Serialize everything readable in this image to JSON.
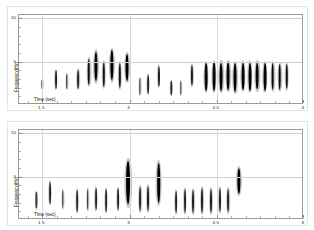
{
  "figure": {
    "panels": [
      {
        "id": "panel-top",
        "name": "top-spectrogram-panel",
        "axis_title_x": "Time (sec)",
        "axis_title_y": "Frequency(Hz)",
        "x_ticks": [
          "1.5",
          "3",
          "4.5",
          "6"
        ],
        "y_ticks": [
          "5",
          "10"
        ]
      },
      {
        "id": "panel-bottom",
        "name": "bottom-spectrogram-panel",
        "axis_title_x": "Time (sec)",
        "axis_title_y": "Frequency(Hz)",
        "x_ticks": [
          "1.5",
          "3",
          "4.5",
          "6"
        ],
        "y_ticks": [
          "5",
          "10"
        ]
      }
    ]
  },
  "chart_data": [
    {
      "type": "scatter",
      "title": "",
      "subtitle": "",
      "xlabel": "Time (sec)",
      "ylabel": "Frequency(Hz)",
      "xlim": [
        1.1,
        6.0
      ],
      "ylim": [
        0.0,
        10.4
      ],
      "xticks": [
        1.5,
        3.0,
        4.5,
        6.0
      ],
      "yticks": [
        5,
        10
      ],
      "grid": true,
      "legend": "none",
      "series": [
        {
          "name": "detected bursts (top channel)",
          "points": [
            {
              "t": 1.5,
              "f_center": 2.4,
              "f_width": 1.05,
              "amp": 0.22
            },
            {
              "t": 1.73,
              "f_center": 2.95,
              "f_width": 2.1,
              "amp": 0.55
            },
            {
              "t": 1.92,
              "f_center": 2.7,
              "f_width": 1.7,
              "amp": 0.45
            },
            {
              "t": 2.12,
              "f_center": 3.0,
              "f_width": 2.2,
              "amp": 0.55
            },
            {
              "t": 2.3,
              "f_center": 3.85,
              "f_width": 3.0,
              "amp": 0.75
            },
            {
              "t": 2.43,
              "f_center": 4.45,
              "f_width": 3.4,
              "amp": 0.92
            },
            {
              "t": 2.56,
              "f_center": 3.55,
              "f_width": 2.9,
              "amp": 0.7
            },
            {
              "t": 2.7,
              "f_center": 4.6,
              "f_width": 3.5,
              "amp": 0.95
            },
            {
              "t": 2.83,
              "f_center": 3.4,
              "f_width": 2.8,
              "amp": 0.68
            },
            {
              "t": 2.96,
              "f_center": 4.35,
              "f_width": 3.1,
              "amp": 0.88
            },
            {
              "t": 3.18,
              "f_center": 2.15,
              "f_width": 1.9,
              "amp": 0.42
            },
            {
              "t": 3.32,
              "f_center": 2.4,
              "f_width": 2.2,
              "amp": 0.5
            },
            {
              "t": 3.5,
              "f_center": 3.3,
              "f_width": 2.4,
              "amp": 0.6
            },
            {
              "t": 3.72,
              "f_center": 2.0,
              "f_width": 1.6,
              "amp": 0.4
            },
            {
              "t": 3.88,
              "f_center": 2.0,
              "f_width": 1.6,
              "amp": 0.4
            },
            {
              "t": 4.08,
              "f_center": 3.45,
              "f_width": 2.4,
              "amp": 0.62
            },
            {
              "t": 4.32,
              "f_center": 3.2,
              "f_width": 3.2,
              "amp": 0.8
            },
            {
              "t": 4.45,
              "f_center": 3.3,
              "f_width": 3.3,
              "amp": 0.82
            },
            {
              "t": 4.58,
              "f_center": 3.25,
              "f_width": 3.3,
              "amp": 0.85
            },
            {
              "t": 4.7,
              "f_center": 3.35,
              "f_width": 3.2,
              "amp": 0.83
            },
            {
              "t": 4.82,
              "f_center": 3.2,
              "f_width": 3.3,
              "amp": 0.86
            },
            {
              "t": 4.95,
              "f_center": 3.3,
              "f_width": 3.2,
              "amp": 0.82
            },
            {
              "t": 5.07,
              "f_center": 3.25,
              "f_width": 3.3,
              "amp": 0.85
            },
            {
              "t": 5.2,
              "f_center": 3.35,
              "f_width": 3.1,
              "amp": 0.8
            },
            {
              "t": 5.33,
              "f_center": 3.2,
              "f_width": 3.2,
              "amp": 0.84
            },
            {
              "t": 5.46,
              "f_center": 3.3,
              "f_width": 3.1,
              "amp": 0.8
            },
            {
              "t": 5.58,
              "f_center": 3.25,
              "f_width": 3.0,
              "amp": 0.78
            },
            {
              "t": 5.7,
              "f_center": 3.3,
              "f_width": 2.9,
              "amp": 0.72
            }
          ]
        }
      ]
    },
    {
      "type": "scatter",
      "title": "",
      "subtitle": "",
      "xlabel": "Time (sec)",
      "ylabel": "Frequency(Hz)",
      "xlim": [
        1.1,
        6.0
      ],
      "ylim": [
        0.0,
        10.4
      ],
      "xticks": [
        1.5,
        3.0,
        4.5,
        6.0
      ],
      "yticks": [
        5,
        10
      ],
      "grid": true,
      "legend": "none",
      "series": [
        {
          "name": "detected bursts (bottom channel)",
          "points": [
            {
              "t": 1.4,
              "f_center": 2.3,
              "f_width": 1.9,
              "amp": 0.28
            },
            {
              "t": 1.63,
              "f_center": 3.1,
              "f_width": 2.6,
              "amp": 0.52
            },
            {
              "t": 1.85,
              "f_center": 2.4,
              "f_width": 2.1,
              "amp": 0.45
            },
            {
              "t": 2.1,
              "f_center": 2.2,
              "f_width": 2.6,
              "amp": 0.48
            },
            {
              "t": 2.28,
              "f_center": 2.35,
              "f_width": 2.5,
              "amp": 0.5
            },
            {
              "t": 2.42,
              "f_center": 2.45,
              "f_width": 2.6,
              "amp": 0.52
            },
            {
              "t": 2.6,
              "f_center": 2.25,
              "f_width": 2.7,
              "amp": 0.5
            },
            {
              "t": 2.8,
              "f_center": 2.4,
              "f_width": 2.5,
              "amp": 0.52
            },
            {
              "t": 2.98,
              "f_center": 4.3,
              "f_width": 5.0,
              "amp": 1.15
            },
            {
              "t": 3.18,
              "f_center": 2.45,
              "f_width": 2.8,
              "amp": 0.55
            },
            {
              "t": 3.32,
              "f_center": 2.5,
              "f_width": 2.9,
              "amp": 0.6
            },
            {
              "t": 3.5,
              "f_center": 4.25,
              "f_width": 4.6,
              "amp": 1.05
            },
            {
              "t": 3.8,
              "f_center": 2.1,
              "f_width": 2.6,
              "amp": 0.52
            },
            {
              "t": 3.95,
              "f_center": 2.2,
              "f_width": 2.7,
              "amp": 0.55
            },
            {
              "t": 4.1,
              "f_center": 2.15,
              "f_width": 2.7,
              "amp": 0.58
            },
            {
              "t": 4.25,
              "f_center": 2.25,
              "f_width": 2.8,
              "amp": 0.58
            },
            {
              "t": 4.4,
              "f_center": 2.2,
              "f_width": 2.7,
              "amp": 0.6
            },
            {
              "t": 4.55,
              "f_center": 2.3,
              "f_width": 2.8,
              "amp": 0.58
            },
            {
              "t": 4.7,
              "f_center": 2.25,
              "f_width": 2.6,
              "amp": 0.55
            },
            {
              "t": 4.88,
              "f_center": 4.55,
              "f_width": 3.0,
              "amp": 0.95
            }
          ]
        }
      ]
    }
  ]
}
